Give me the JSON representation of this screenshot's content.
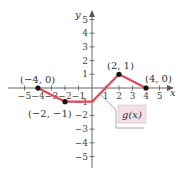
{
  "chart_data": {
    "type": "line",
    "title": "",
    "xlabel": "x",
    "ylabel": "y",
    "xlim": [
      -5,
      5
    ],
    "ylim": [
      -5,
      5
    ],
    "grid": false,
    "x_ticks": [
      -5,
      -4,
      -3,
      -2,
      -1,
      1,
      2,
      3,
      4,
      5
    ],
    "y_ticks": [
      -5,
      -4,
      -3,
      -2,
      -1,
      1,
      2,
      3,
      4,
      5
    ],
    "series": [
      {
        "name": "g(x)",
        "color": "#e8475a",
        "points": [
          [
            -4,
            0
          ],
          [
            -2,
            -1
          ],
          [
            0,
            -1
          ],
          [
            2,
            1
          ],
          [
            4,
            0
          ]
        ]
      }
    ],
    "annotations": [
      "(-4, 0)",
      "(-2, -1)",
      "(2, 1)",
      "(4, 0)"
    ],
    "legend_label": "g(x)"
  },
  "labels": {
    "x_axis": "x",
    "y_axis": "y",
    "func": "g(x)",
    "p1": "(−4, 0)",
    "p2": "(−2, −1)",
    "p3": "(2, 1)",
    "p4": "(4, 0)"
  }
}
